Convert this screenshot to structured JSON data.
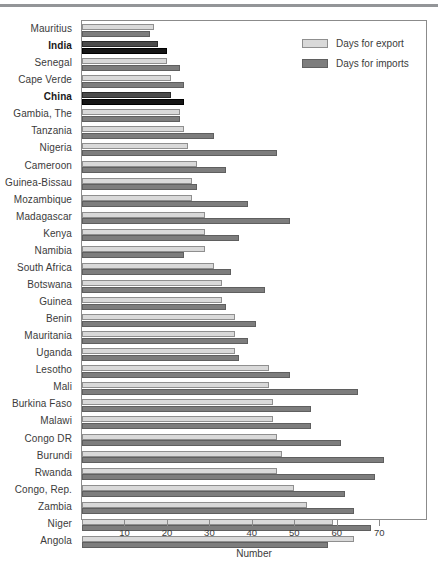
{
  "chart_data": {
    "type": "bar",
    "orientation": "horizontal",
    "title": "",
    "xlabel": "Number",
    "ylabel": "",
    "xlim": [
      0,
      81
    ],
    "xticks": [
      10,
      20,
      30,
      40,
      50,
      60,
      70
    ],
    "grid": false,
    "legend_position": "top-right",
    "colors": {
      "export": "#d9d9d9",
      "imports": "#7d7d7d",
      "highlight_export": "#4a4a4a",
      "highlight_imports": "#151515",
      "frame": "#8b8b8b",
      "text": "#3b3b3b"
    },
    "categories": [
      "Mauritius",
      "India",
      "Senegal",
      "Cape Verde",
      "China",
      "Gambia, The",
      "Tanzania",
      "Nigeria",
      "Cameroon",
      "Guinea-Bissau",
      "Mozambique",
      "Madagascar",
      "Kenya",
      "Namibia",
      "South Africa",
      "Botswana",
      "Guinea",
      "Benin",
      "Mauritania",
      "Uganda",
      "Lesotho",
      "Mali",
      "Burkina Faso",
      "Malawi",
      "Congo DR",
      "Burundi",
      "Rwanda",
      "Congo, Rep.",
      "Zambia",
      "Niger",
      "Angola"
    ],
    "highlighted_categories": [
      "India",
      "China"
    ],
    "series": [
      {
        "name": "Days for export",
        "values": [
          17,
          18,
          20,
          21,
          21,
          23,
          24,
          25,
          27,
          26,
          26,
          29,
          29,
          29,
          31,
          33,
          33,
          36,
          36,
          36,
          44,
          44,
          45,
          45,
          46,
          47,
          46,
          50,
          53,
          59,
          64
        ]
      },
      {
        "name": "Days for imports",
        "values": [
          16,
          20,
          23,
          24,
          24,
          23,
          31,
          46,
          34,
          27,
          39,
          49,
          37,
          24,
          35,
          43,
          34,
          41,
          39,
          37,
          49,
          65,
          54,
          54,
          61,
          71,
          69,
          62,
          64,
          68,
          58
        ]
      }
    ]
  },
  "legend": {
    "entries": [
      {
        "label": "Days for export",
        "swatch": "export-swatch"
      },
      {
        "label": "Days for imports",
        "swatch": "imports-swatch"
      }
    ]
  },
  "axis": {
    "x_title": "Number",
    "x_tick_labels": [
      "10",
      "20",
      "30",
      "40",
      "50",
      "60",
      "70"
    ]
  }
}
